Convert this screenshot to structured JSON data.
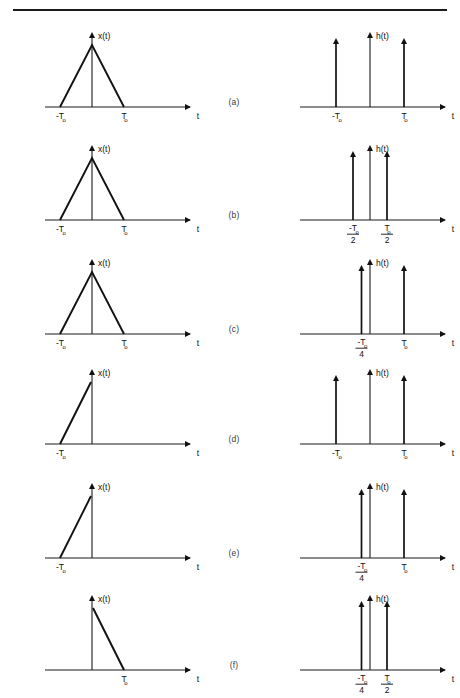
{
  "figure": {
    "top_rule": true,
    "axis_color": "#111111",
    "page_width": 460,
    "page_height": 698
  },
  "labels": {
    "x_function": "x(t)",
    "h_function": "h(t)",
    "time_axis": "t",
    "T_symbol": "T",
    "T_subscript": "o",
    "minus": "-"
  },
  "rows": [
    {
      "id": "a",
      "row_label": "(a)",
      "left": {
        "function_label": "x(t)",
        "axis_label": "t",
        "signal_type": "triangle",
        "ticks": [
          {
            "text": "-T",
            "sub": "o",
            "value": -1
          },
          {
            "text": "T",
            "sub": "o",
            "value": 1
          }
        ]
      },
      "right": {
        "function_label": "h(t)",
        "axis_label": "t",
        "signal_type": "impulses",
        "impulses": [
          {
            "value": -1,
            "label": "-T",
            "sub": "o",
            "denominator": ""
          },
          {
            "value": 0,
            "label": "",
            "sub": "",
            "denominator": ""
          },
          {
            "value": 1,
            "label": "T",
            "sub": "o",
            "denominator": ""
          }
        ]
      }
    },
    {
      "id": "b",
      "row_label": "(b)",
      "left": {
        "function_label": "x(t)",
        "axis_label": "t",
        "signal_type": "triangle",
        "ticks": [
          {
            "text": "-T",
            "sub": "o",
            "value": -1
          },
          {
            "text": "T",
            "sub": "o",
            "value": 1
          }
        ]
      },
      "right": {
        "function_label": "h(t)",
        "axis_label": "t",
        "signal_type": "impulses",
        "impulses": [
          {
            "value": -0.5,
            "label": "-T",
            "sub": "o",
            "denominator": "2"
          },
          {
            "value": 0.5,
            "label": "T",
            "sub": "o",
            "denominator": "2"
          }
        ]
      }
    },
    {
      "id": "c",
      "row_label": "(c)",
      "left": {
        "function_label": "x(t)",
        "axis_label": "t",
        "signal_type": "triangle",
        "ticks": [
          {
            "text": "-T",
            "sub": "o",
            "value": -1
          },
          {
            "text": "T",
            "sub": "o",
            "value": 1
          }
        ]
      },
      "right": {
        "function_label": "h(t)",
        "axis_label": "t",
        "signal_type": "impulses",
        "impulses": [
          {
            "value": -0.25,
            "label": "-T",
            "sub": "o",
            "denominator": "4"
          },
          {
            "value": 1,
            "label": "T",
            "sub": "o",
            "denominator": ""
          }
        ]
      }
    },
    {
      "id": "d",
      "row_label": "(d)",
      "left": {
        "function_label": "x(t)",
        "axis_label": "t",
        "signal_type": "ramp-up",
        "ticks": [
          {
            "text": "-T",
            "sub": "o",
            "value": -1
          }
        ]
      },
      "right": {
        "function_label": "h(t)",
        "axis_label": "t",
        "signal_type": "impulses",
        "impulses": [
          {
            "value": -1,
            "label": "-T",
            "sub": "o",
            "denominator": ""
          },
          {
            "value": 0,
            "label": "",
            "sub": "",
            "denominator": ""
          },
          {
            "value": 1,
            "label": "T",
            "sub": "o",
            "denominator": ""
          }
        ]
      }
    },
    {
      "id": "e",
      "row_label": "(e)",
      "left": {
        "function_label": "x(t)",
        "axis_label": "t",
        "signal_type": "ramp-up",
        "ticks": [
          {
            "text": "-T",
            "sub": "o",
            "value": -1
          }
        ]
      },
      "right": {
        "function_label": "h(t)",
        "axis_label": "t",
        "signal_type": "impulses",
        "impulses": [
          {
            "value": -0.25,
            "label": "-T",
            "sub": "o",
            "denominator": "4"
          },
          {
            "value": 1,
            "label": "T",
            "sub": "o",
            "denominator": ""
          }
        ]
      }
    },
    {
      "id": "f",
      "row_label": "(f)",
      "left": {
        "function_label": "x(t)",
        "axis_label": "t",
        "signal_type": "ramp-down",
        "ticks": [
          {
            "text": "T",
            "sub": "o",
            "value": 1
          }
        ]
      },
      "right": {
        "function_label": "h(t)",
        "axis_label": "t",
        "signal_type": "impulses",
        "impulses": [
          {
            "value": -0.25,
            "label": "-T",
            "sub": "o",
            "denominator": "4"
          },
          {
            "value": 0.5,
            "label": "T",
            "sub": "o",
            "denominator": "2"
          }
        ]
      }
    }
  ],
  "chart_data": {
    "type": "line",
    "xlabel": "t",
    "ylabel": "",
    "panels": [
      {
        "row": "(a)",
        "signal": "x(t)",
        "description": "triangular pulse",
        "points": [
          [
            -1,
            0
          ],
          [
            0,
            1
          ],
          [
            1,
            0
          ]
        ]
      },
      {
        "row": "(a)",
        "signal": "h(t)",
        "description": "impulse train",
        "impulse_locations": [
          -1,
          0,
          1
        ],
        "impulse_labels": [
          "-To",
          "0",
          "To"
        ]
      },
      {
        "row": "(b)",
        "signal": "x(t)",
        "description": "triangular pulse",
        "points": [
          [
            -1,
            0
          ],
          [
            0,
            1
          ],
          [
            1,
            0
          ]
        ]
      },
      {
        "row": "(b)",
        "signal": "h(t)",
        "description": "impulse train",
        "impulse_locations": [
          -0.5,
          0.5
        ],
        "impulse_labels": [
          "-To/2",
          "To/2"
        ]
      },
      {
        "row": "(c)",
        "signal": "x(t)",
        "description": "triangular pulse",
        "points": [
          [
            -1,
            0
          ],
          [
            0,
            1
          ],
          [
            1,
            0
          ]
        ]
      },
      {
        "row": "(c)",
        "signal": "h(t)",
        "description": "impulse train",
        "impulse_locations": [
          -0.25,
          1
        ],
        "impulse_labels": [
          "-To/4",
          "To"
        ]
      },
      {
        "row": "(d)",
        "signal": "x(t)",
        "description": "rising ramp",
        "points": [
          [
            -1,
            0
          ],
          [
            0,
            1
          ]
        ]
      },
      {
        "row": "(d)",
        "signal": "h(t)",
        "description": "impulse train",
        "impulse_locations": [
          -1,
          0,
          1
        ],
        "impulse_labels": [
          "-To",
          "0",
          "To"
        ]
      },
      {
        "row": "(e)",
        "signal": "x(t)",
        "description": "rising ramp",
        "points": [
          [
            -1,
            0
          ],
          [
            0,
            1
          ]
        ]
      },
      {
        "row": "(e)",
        "signal": "h(t)",
        "description": "impulse train",
        "impulse_locations": [
          -0.25,
          1
        ],
        "impulse_labels": [
          "-To/4",
          "To"
        ]
      },
      {
        "row": "(f)",
        "signal": "x(t)",
        "description": "falling ramp",
        "points": [
          [
            0,
            1
          ],
          [
            1,
            0
          ]
        ]
      },
      {
        "row": "(f)",
        "signal": "h(t)",
        "description": "impulse train",
        "impulse_locations": [
          -0.25,
          0.5
        ],
        "impulse_labels": [
          "-To/4",
          "To/2"
        ]
      }
    ]
  }
}
